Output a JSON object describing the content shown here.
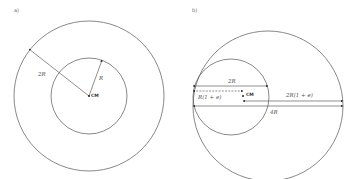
{
  "panel_a": {
    "label": "a)",
    "radius_label": "R",
    "distance_label": "2R",
    "center_label": "CM"
  },
  "panel_b": {
    "label": "b)",
    "diameter_small_label": "2R",
    "offset_label": "R(1 + e)",
    "center_label": "CM",
    "offset_large_label": "2R(1 + e)",
    "diameter_large_label": "4R"
  }
}
